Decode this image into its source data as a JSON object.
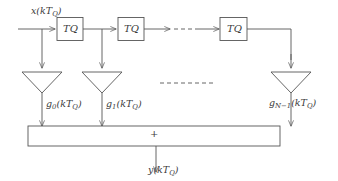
{
  "diagram": {
    "stroke_color": "#555555",
    "text_color": "#3a3a3a",
    "background": "#ffffff",
    "input": {
      "signal": "x",
      "argument": "(kT",
      "subscript": "Q",
      "close": ")",
      "full_label": "x(kTQ)"
    },
    "output": {
      "signal": "y",
      "argument": "(kT",
      "subscript": "Q",
      "close": ")",
      "full_label": "y(kTQ)"
    },
    "delay_blocks": [
      {
        "label": "T",
        "subscript": "Q",
        "full_label": "TQ"
      },
      {
        "label": "T",
        "subscript": "Q",
        "full_label": "TQ"
      },
      {
        "label": "T",
        "subscript": "Q",
        "full_label": "TQ"
      }
    ],
    "gains": [
      {
        "symbol": "g",
        "index": "0",
        "argument": "(kT",
        "subscript": "Q",
        "close": ")",
        "full_label": "g0(kTQ)"
      },
      {
        "symbol": "g",
        "index": "1",
        "argument": "(kT",
        "subscript": "Q",
        "close": ")",
        "full_label": "g1(kTQ)"
      },
      {
        "symbol": "g",
        "index": "N−1",
        "argument": "(kT",
        "subscript": "Q",
        "close": ")",
        "full_label": "gN-1(kTQ)"
      }
    ],
    "summer": {
      "operator": "+"
    },
    "ellipsis": {
      "top_row": "dashed-line",
      "middle_row": "dashed-line"
    }
  }
}
